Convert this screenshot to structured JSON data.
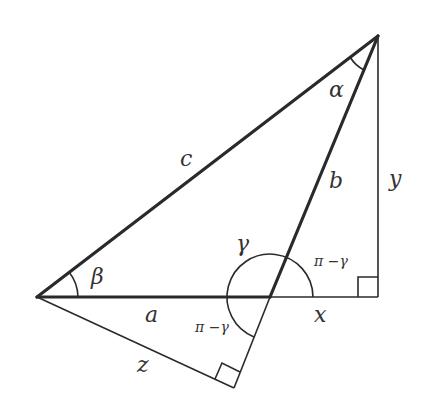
{
  "diagram": {
    "title": "",
    "labels": {
      "side_c": "c",
      "side_b": "b",
      "side_a": "a",
      "side_x": "x",
      "side_y": "y",
      "side_z": "z",
      "angle_alpha": "α",
      "angle_beta": "β",
      "angle_gamma": "γ",
      "angle_pi_minus_gamma_upper": "π −γ",
      "angle_pi_minus_gamma_lower": "π −γ"
    },
    "vertices": {
      "top": [
        378,
        36
      ],
      "left": [
        37,
        297
      ],
      "middle": [
        270,
        297
      ],
      "right_foot": [
        378,
        297
      ],
      "bottom_foot": [
        234,
        388
      ]
    },
    "right_angles": [
      "right_foot",
      "bottom_foot"
    ],
    "stroke_color": "#2a2a2a",
    "background": "#ffffff"
  }
}
